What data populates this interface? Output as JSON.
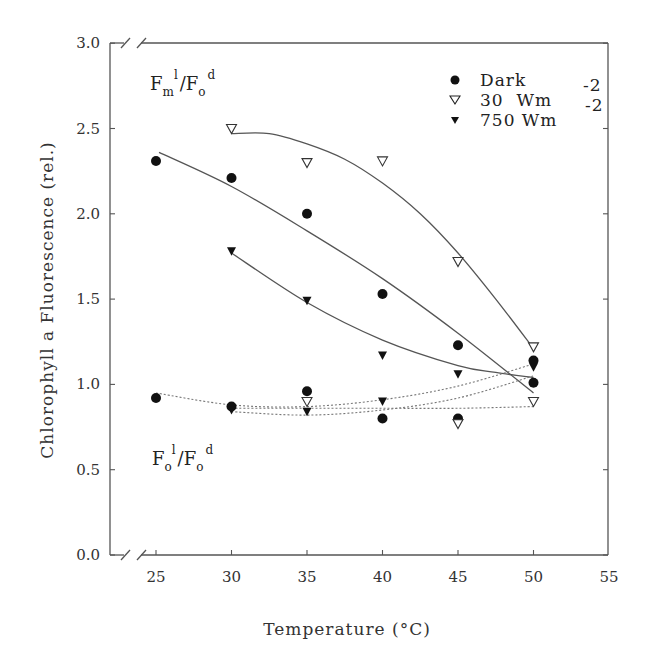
{
  "chart_data": {
    "type": "scatter",
    "title": "",
    "xlabel": "Temperature (°C)",
    "ylabel": "Chlorophyll a Fluorescence (rel.)",
    "xlim": [
      23,
      55
    ],
    "ylim": [
      0.0,
      3.0
    ],
    "x_ticks": [
      "25",
      "30",
      "35",
      "40",
      "45",
      "50",
      "55"
    ],
    "y_ticks": [
      "0.0",
      "0.5",
      "1.0",
      "1.5",
      "2.0",
      "2.5",
      "3.0"
    ],
    "axis_breaks": true,
    "grid": false,
    "legend_position": "upper right",
    "legend": [
      {
        "label": "Dark",
        "marker": "filled-circle"
      },
      {
        "label": "30  Wm",
        "superscript": "-2",
        "marker": "open-triangle-down"
      },
      {
        "label": "750 Wm",
        "superscript": "-2",
        "marker": "filled-triangle-down"
      }
    ],
    "annotations": [
      {
        "text": "Fm l / Fo d",
        "main": "F",
        "sub1": "m",
        "sup1": "l",
        "main2": "/F",
        "sub2": "o",
        "sup2": "d",
        "position": "upper-left"
      },
      {
        "text": "Fo l / Fo d",
        "main": "F",
        "sub1": "o",
        "sup1": "l",
        "main2": "/F",
        "sub2": "o",
        "sup2": "d",
        "position": "lower-left"
      }
    ],
    "series": [
      {
        "name": "Dark Fm/Fo",
        "group": "Fm_l/Fo_d",
        "marker": "filled-circle",
        "fit": "solid",
        "x": [
          25,
          30,
          35,
          40,
          45,
          50
        ],
        "y": [
          2.31,
          2.21,
          2.0,
          1.53,
          1.23,
          1.14
        ]
      },
      {
        "name": "30 Wm-2 Fm/Fo",
        "group": "Fm_l/Fo_d",
        "marker": "open-triangle-down",
        "fit": "solid",
        "x": [
          30,
          35,
          40,
          45,
          50
        ],
        "y": [
          2.5,
          2.3,
          2.31,
          1.72,
          1.22
        ]
      },
      {
        "name": "750 Wm-2 Fm/Fo",
        "group": "Fm_l/Fo_d",
        "marker": "filled-triangle-down",
        "fit": "solid",
        "x": [
          30,
          35,
          40,
          45,
          50
        ],
        "y": [
          1.78,
          1.49,
          1.17,
          1.06,
          1.1
        ]
      },
      {
        "name": "Dark Fo/Fo",
        "group": "Fo_l/Fo_d",
        "marker": "filled-circle",
        "fit": "dotted",
        "x": [
          25,
          30,
          35,
          40,
          45,
          50
        ],
        "y": [
          0.92,
          0.87,
          0.96,
          0.8,
          0.8,
          1.01
        ]
      },
      {
        "name": "30 Wm-2 Fo/Fo",
        "group": "Fo_l/Fo_d",
        "marker": "open-triangle-down",
        "fit": "dotted",
        "x": [
          35,
          45,
          50
        ],
        "y": [
          0.9,
          0.77,
          0.9
        ]
      },
      {
        "name": "750 Wm-2 Fo/Fo",
        "group": "Fo_l/Fo_d",
        "marker": "filled-triangle-down",
        "fit": "dotted",
        "x": [
          30,
          35,
          40
        ],
        "y": [
          0.85,
          0.84,
          0.9
        ]
      }
    ],
    "fit_curves": [
      {
        "series": "Dark Fm/Fo",
        "style": "solid",
        "points": [
          [
            25.2,
            2.36
          ],
          [
            30,
            2.16
          ],
          [
            35,
            1.9
          ],
          [
            40,
            1.62
          ],
          [
            45,
            1.3
          ],
          [
            50,
            0.95
          ]
        ]
      },
      {
        "series": "30 Wm-2 Fm/Fo",
        "style": "solid",
        "points": [
          [
            30,
            2.47
          ],
          [
            32.5,
            2.47
          ],
          [
            35,
            2.41
          ],
          [
            37.5,
            2.32
          ],
          [
            40,
            2.18
          ],
          [
            42.5,
            2.0
          ],
          [
            45,
            1.77
          ],
          [
            47.5,
            1.5
          ],
          [
            50,
            1.21
          ]
        ]
      },
      {
        "series": "750 Wm-2 Fm/Fo",
        "style": "solid",
        "points": [
          [
            30,
            1.77
          ],
          [
            35,
            1.48
          ],
          [
            40,
            1.26
          ],
          [
            45,
            1.11
          ],
          [
            47.5,
            1.07
          ],
          [
            50,
            1.04
          ]
        ]
      },
      {
        "series": "Dark Fo/Fo",
        "style": "dotted",
        "points": [
          [
            25,
            0.95
          ],
          [
            30,
            0.88
          ],
          [
            35,
            0.87
          ],
          [
            40,
            0.91
          ],
          [
            45,
            0.99
          ],
          [
            50,
            1.12
          ]
        ]
      },
      {
        "series": "30 Wm-2 Fo/Fo",
        "style": "dotted",
        "points": [
          [
            30,
            0.86
          ],
          [
            35,
            0.86
          ],
          [
            40,
            0.86
          ],
          [
            45,
            0.86
          ],
          [
            50,
            0.87
          ]
        ]
      },
      {
        "series": "750 Wm-2 Fo/Fo",
        "style": "dotted",
        "points": [
          [
            30,
            0.84
          ],
          [
            35,
            0.82
          ],
          [
            40,
            0.85
          ],
          [
            45,
            0.92
          ],
          [
            50,
            1.05
          ]
        ]
      }
    ]
  }
}
